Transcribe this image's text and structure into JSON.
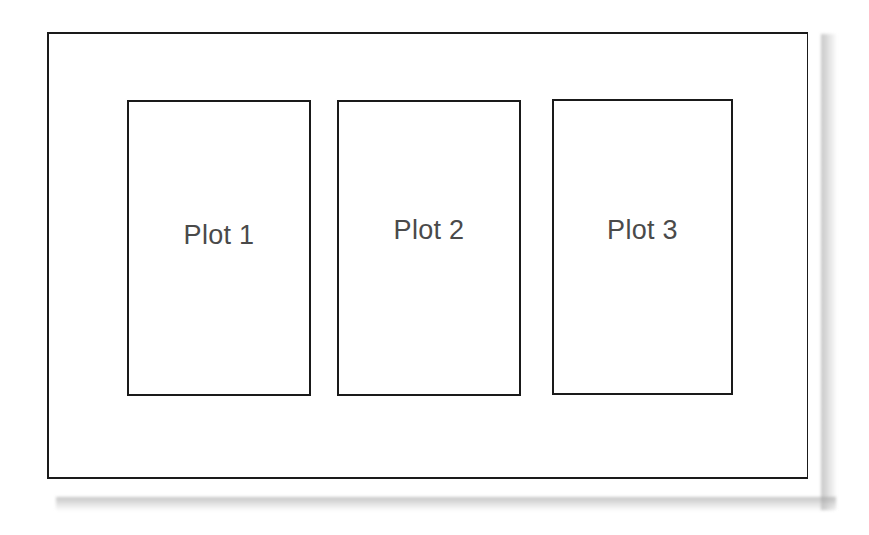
{
  "diagram": {
    "type": "layout-schematic",
    "frame": {
      "border_color": "#1a1a1a",
      "background": "#ffffff",
      "shadow_color": "#9a9a9a"
    },
    "panels": [
      {
        "label": "Plot 1"
      },
      {
        "label": "Plot 2"
      },
      {
        "label": "Plot 3"
      }
    ],
    "label_color": "#4a4a4a"
  }
}
